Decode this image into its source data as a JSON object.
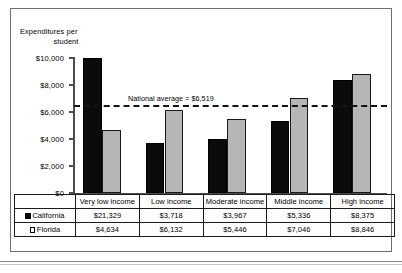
{
  "chart_data": {
    "type": "bar",
    "title": "",
    "ylabel": "Expenditures per student",
    "xlabel": "",
    "categories": [
      "Very low income",
      "Low income",
      "Moderate income",
      "Middle income",
      "High income"
    ],
    "series": [
      {
        "name": "California",
        "values": [
          21329,
          3718,
          3967,
          5336,
          8375
        ],
        "value_labels": [
          "$21,329",
          "$3,718",
          "$3,967",
          "$5,336",
          "$8,375"
        ],
        "color": "#0b0b0b",
        "swatch": "black"
      },
      {
        "name": "Florida",
        "values": [
          4634,
          6132,
          5446,
          7046,
          8846
        ],
        "value_labels": [
          "$4,634",
          "$6,132",
          "$5,446",
          "$7,046",
          "$8,846"
        ],
        "color": "#b6b6b6",
        "swatch": "white"
      }
    ],
    "ylim": [
      0,
      10000
    ],
    "yticks": [
      0,
      2000,
      4000,
      6000,
      8000,
      10000
    ],
    "ytick_labels": [
      "$0",
      "$2,000",
      "$4,000",
      "$6,000",
      "$8,000",
      "$10,000"
    ],
    "grid": false,
    "legend_position": "table-row-headers",
    "annotations": [
      {
        "name": "national-average",
        "label": "National average = $6,519",
        "value": 6519
      }
    ]
  },
  "axis_title": {
    "line1": "Expenditures per",
    "line2": "student"
  },
  "annotation": {
    "national_average": "National average = $6,519"
  },
  "table": {
    "categories": [
      "Very low income",
      "Low income",
      "Moderate income",
      "Middle income",
      "High income"
    ],
    "rows": [
      {
        "label": "California",
        "values": [
          "$21,329",
          "$3,718",
          "$3,967",
          "$5,336",
          "$8,375"
        ]
      },
      {
        "label": "Florida",
        "values": [
          "$4,634",
          "$6,132",
          "$5,446",
          "$7,046",
          "$8,846"
        ]
      }
    ]
  }
}
